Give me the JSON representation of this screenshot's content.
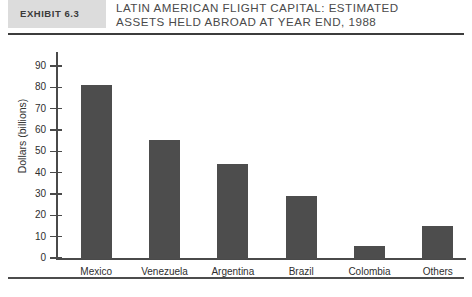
{
  "exhibit": {
    "label": "EXHIBIT 6.3",
    "title_line_1": "LATIN AMERICAN FLIGHT CAPITAL: ESTIMATED",
    "title_line_2": "ASSETS HELD ABROAD AT YEAR END, 1988"
  },
  "colors": {
    "bar": "#4d4d4d",
    "band": "#dcdcdc",
    "rule": "#3c3c3c",
    "axis": "#4a4a4a"
  },
  "chart_data": {
    "type": "bar",
    "title": "Latin American Flight Capital: Estimated Assets Held Abroad at Year End, 1988",
    "categories": [
      "Mexico",
      "Venezuela",
      "Argentina",
      "Brazil",
      "Colombia",
      "Others"
    ],
    "values": [
      81.5,
      56,
      44.5,
      29.5,
      6,
      15.5
    ],
    "xlabel": "",
    "ylabel": "Dollars (billions)",
    "ylim": [
      0,
      90
    ],
    "yticks": [
      0,
      10,
      20,
      30,
      40,
      50,
      60,
      70,
      80,
      90
    ],
    "ytick_labels": [
      "0",
      "10",
      "20",
      "30",
      "40",
      "50",
      "60",
      "70",
      "80",
      "90"
    ],
    "grid": false,
    "legend": false
  }
}
